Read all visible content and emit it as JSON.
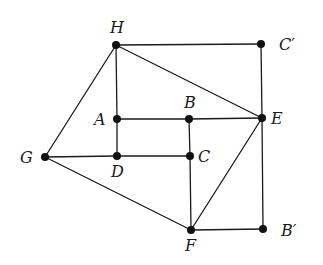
{
  "diagram": {
    "type": "geometry-figure",
    "points": [
      {
        "id": "H",
        "label": "H",
        "x": 116,
        "y": 45,
        "lx": 110,
        "ly": 33
      },
      {
        "id": "Cp",
        "label": "C′",
        "x": 261,
        "y": 44,
        "lx": 279,
        "ly": 50
      },
      {
        "id": "A",
        "label": "A",
        "x": 117,
        "y": 119,
        "lx": 94,
        "ly": 125
      },
      {
        "id": "B",
        "label": "B",
        "x": 189,
        "y": 119,
        "lx": 184,
        "ly": 108
      },
      {
        "id": "E",
        "label": "E",
        "x": 262,
        "y": 118,
        "lx": 271,
        "ly": 124
      },
      {
        "id": "G",
        "label": "G",
        "x": 45,
        "y": 157,
        "lx": 20,
        "ly": 163
      },
      {
        "id": "D",
        "label": "D",
        "x": 117,
        "y": 156,
        "lx": 111,
        "ly": 177
      },
      {
        "id": "C",
        "label": "C",
        "x": 190,
        "y": 156,
        "lx": 198,
        "ly": 162
      },
      {
        "id": "F",
        "label": "F",
        "x": 191,
        "y": 230,
        "lx": 185,
        "ly": 251
      },
      {
        "id": "Bp",
        "label": "B′",
        "x": 263,
        "y": 229,
        "lx": 281,
        "ly": 236
      }
    ],
    "edges": [
      [
        "H",
        "Cp"
      ],
      [
        "Cp",
        "E"
      ],
      [
        "E",
        "Bp"
      ],
      [
        "Bp",
        "F"
      ],
      [
        "H",
        "E"
      ],
      [
        "H",
        "A"
      ],
      [
        "A",
        "D"
      ],
      [
        "A",
        "B"
      ],
      [
        "B",
        "E"
      ],
      [
        "B",
        "C"
      ],
      [
        "C",
        "F"
      ],
      [
        "D",
        "C"
      ],
      [
        "G",
        "D"
      ],
      [
        "H",
        "G"
      ],
      [
        "G",
        "F"
      ],
      [
        "F",
        "E"
      ]
    ]
  }
}
